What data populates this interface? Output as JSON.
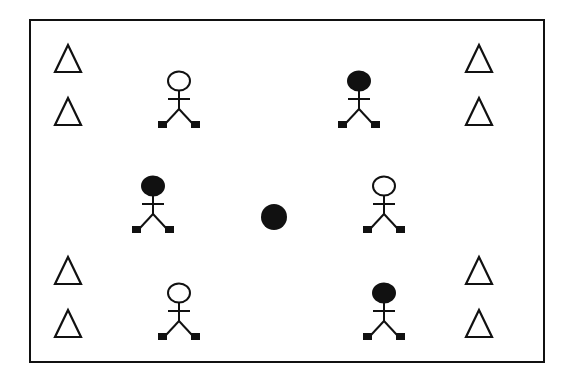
{
  "diagram": {
    "title": "",
    "colors": {
      "stroke": "#111111",
      "background": "#ffffff",
      "filled": "#111111"
    },
    "field": {
      "x": 30,
      "y": 20,
      "width": 514,
      "height": 342
    },
    "ball": {
      "cx": 274,
      "cy": 217,
      "r": 13
    },
    "cones": [
      {
        "id": "cone-top-left-1",
        "cx": 68,
        "apex": 45,
        "base": 72
      },
      {
        "id": "cone-top-left-2",
        "cx": 68,
        "apex": 98,
        "base": 125
      },
      {
        "id": "cone-bottom-left-1",
        "cx": 68,
        "apex": 257,
        "base": 284
      },
      {
        "id": "cone-bottom-left-2",
        "cx": 68,
        "apex": 310,
        "base": 337
      },
      {
        "id": "cone-top-right-1",
        "cx": 479,
        "apex": 45,
        "base": 72
      },
      {
        "id": "cone-top-right-2",
        "cx": 479,
        "apex": 98,
        "base": 125
      },
      {
        "id": "cone-bottom-right-1",
        "cx": 479,
        "apex": 257,
        "base": 284
      },
      {
        "id": "cone-bottom-right-2",
        "cx": 479,
        "apex": 310,
        "base": 337
      }
    ],
    "players": [
      {
        "id": "player-open-top-left",
        "cx": 179,
        "head_cy": 81,
        "team": "open"
      },
      {
        "id": "player-filled-top-right",
        "cx": 359,
        "head_cy": 81,
        "team": "filled"
      },
      {
        "id": "player-filled-mid-left",
        "cx": 153,
        "head_cy": 186,
        "team": "filled"
      },
      {
        "id": "player-open-mid-right",
        "cx": 384,
        "head_cy": 186,
        "team": "open"
      },
      {
        "id": "player-open-bottom-left",
        "cx": 179,
        "head_cy": 293,
        "team": "open"
      },
      {
        "id": "player-filled-bottom-right",
        "cx": 384,
        "head_cy": 293,
        "team": "filled"
      }
    ]
  }
}
